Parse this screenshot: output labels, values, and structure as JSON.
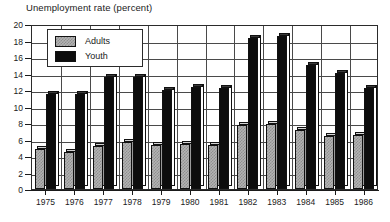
{
  "chart_data": {
    "type": "bar",
    "title": "Unemployment rate (percent)",
    "xlabel": "",
    "ylabel": "",
    "ylim": [
      0,
      20
    ],
    "ytick_step": 2,
    "grid": true,
    "legend_position": "top-left",
    "categories": [
      "1975",
      "1976",
      "1977",
      "1978",
      "1979",
      "1980",
      "1981",
      "1982",
      "1983",
      "1984",
      "1985",
      "1986"
    ],
    "yticks": [
      "0",
      "2",
      "4",
      "6",
      "8",
      "10",
      "12",
      "14",
      "16",
      "18",
      "20"
    ],
    "series": [
      {
        "name": "Adults",
        "color": "#b3b3b3",
        "values": [
          4.9,
          4.5,
          5.2,
          5.7,
          5.3,
          5.5,
          5.3,
          7.8,
          7.9,
          7.2,
          6.4,
          6.5
        ]
      },
      {
        "name": "Youth",
        "color": "#0d0d0d",
        "values": [
          11.5,
          11.5,
          13.6,
          13.6,
          12.0,
          12.4,
          12.3,
          18.3,
          18.5,
          15.0,
          14.1,
          12.2
        ]
      }
    ]
  },
  "legend": {
    "items": [
      {
        "label": "Adults",
        "swatch": "adults-swatch"
      },
      {
        "label": "Youth",
        "swatch": "youth-swatch"
      }
    ]
  }
}
